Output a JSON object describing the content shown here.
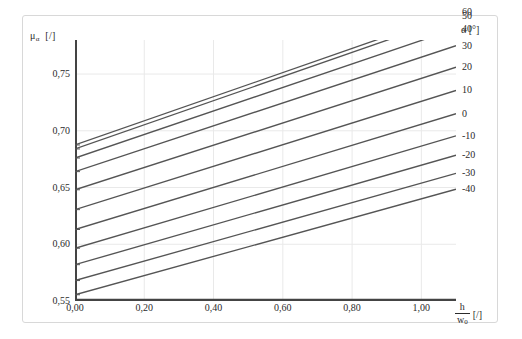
{
  "chart_data": {
    "type": "line",
    "title": "",
    "subtitle": "",
    "xlabel": "h/w0 [/]",
    "ylabel": "mu_alpha [/]",
    "xlabel_num": "h",
    "xlabel_den": "w",
    "xlabel_den_sub": "0",
    "xlabel_unit": "[/]",
    "ylabel_sym": "μ",
    "ylabel_sub": "α",
    "ylabel_unit": "[/]",
    "legend_title": "α [°]",
    "legend_position": "right",
    "grid": true,
    "xlim": [
      0.0,
      1.1
    ],
    "ylim": [
      0.55,
      0.78
    ],
    "xticks": [
      0.0,
      0.2,
      0.4,
      0.6,
      0.8,
      1.0
    ],
    "xticklabels": [
      "0,00",
      "0,20",
      "0,40",
      "0,60",
      "0,80",
      "1,00"
    ],
    "yticks": [
      0.55,
      0.6,
      0.65,
      0.7,
      0.75
    ],
    "yticklabels": [
      "0,55",
      "0,60",
      "0,65",
      "0,70",
      "0,75"
    ],
    "x": [
      0.0,
      1.1
    ],
    "series": [
      {
        "name": "60",
        "label": "60",
        "values": [
          0.6875,
          0.8045
        ]
      },
      {
        "name": "50",
        "label": "50",
        "values": [
          0.684,
          0.801
        ]
      },
      {
        "name": "40",
        "label": "40",
        "values": [
          0.676,
          0.79
        ]
      },
      {
        "name": "30",
        "label": "30",
        "values": [
          0.664,
          0.775
        ]
      },
      {
        "name": "20",
        "label": "20",
        "values": [
          0.648,
          0.756
        ]
      },
      {
        "name": "10",
        "label": "10",
        "values": [
          0.6305,
          0.7355
        ]
      },
      {
        "name": "0",
        "label": "0",
        "values": [
          0.613,
          0.715
        ]
      },
      {
        "name": "-10",
        "label": "-10",
        "values": [
          0.5965,
          0.6955
        ]
      },
      {
        "name": "-20",
        "label": "-20",
        "values": [
          0.582,
          0.6785
        ]
      },
      {
        "name": "-30",
        "label": "-30",
        "values": [
          0.568,
          0.6625
        ]
      },
      {
        "name": "-40",
        "label": "-40",
        "values": [
          0.5555,
          0.6485
        ]
      }
    ],
    "line_color": "#555555",
    "grid_color": "#e9e9e9",
    "axis_color": "#444444",
    "frame_color": "#d8d8d8",
    "background": "#ffffff"
  }
}
